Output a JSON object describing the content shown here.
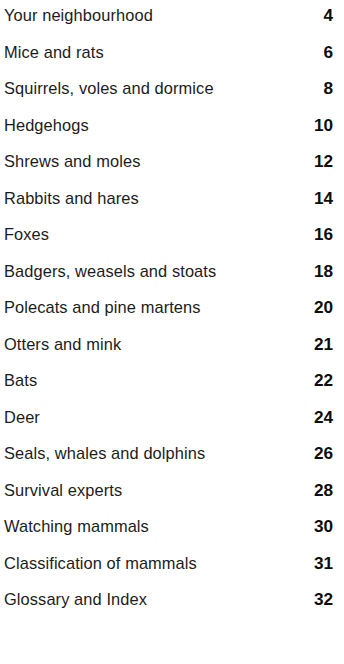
{
  "document": {
    "type": "table-of-contents",
    "background_color": "#ffffff",
    "text_color": "#1c1c1c",
    "page_number_color": "#0d0d0d"
  },
  "contents": {
    "entries": [
      {
        "title": "Your neighbourhood",
        "page": "4"
      },
      {
        "title": "Mice and rats",
        "page": "6"
      },
      {
        "title": "Squirrels, voles and dormice",
        "page": "8"
      },
      {
        "title": "Hedgehogs",
        "page": "10"
      },
      {
        "title": "Shrews and moles",
        "page": "12"
      },
      {
        "title": "Rabbits and hares",
        "page": "14"
      },
      {
        "title": "Foxes",
        "page": "16"
      },
      {
        "title": "Badgers, weasels and stoats",
        "page": "18"
      },
      {
        "title": "Polecats and pine martens",
        "page": "20"
      },
      {
        "title": "Otters and mink",
        "page": "21"
      },
      {
        "title": "Bats",
        "page": "22"
      },
      {
        "title": "Deer",
        "page": "24"
      },
      {
        "title": "Seals, whales and dolphins",
        "page": "26"
      },
      {
        "title": "Survival experts",
        "page": "28"
      },
      {
        "title": "Watching mammals",
        "page": "30"
      },
      {
        "title": "Classification of mammals",
        "page": "31"
      },
      {
        "title": "Glossary and Index",
        "page": "32"
      }
    ]
  }
}
